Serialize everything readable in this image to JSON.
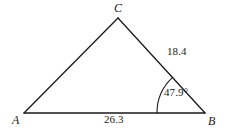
{
  "figure": {
    "type": "triangle-diagram",
    "background_color": "#ffffff",
    "stroke_color": "#1a1a1a"
  },
  "vertices": [
    {
      "id": "A",
      "label": "A",
      "x": 24,
      "y": 113
    },
    {
      "id": "B",
      "label": "B",
      "x": 205,
      "y": 113
    },
    {
      "id": "C",
      "label": "C",
      "x": 118,
      "y": 18
    }
  ],
  "sides": [
    {
      "id": "AB",
      "from": "A",
      "to": "B",
      "label": "26.3",
      "label_position": "below"
    },
    {
      "id": "CB",
      "from": "C",
      "to": "B",
      "label": "18.4",
      "label_position": "right"
    },
    {
      "id": "AC",
      "from": "A",
      "to": "C",
      "label": "",
      "label_position": "none"
    }
  ],
  "angles": [
    {
      "id": "angle-B",
      "vertex": "B",
      "label": "47.9°",
      "value": 47.9,
      "unit": "degrees",
      "arc_radius": 48
    }
  ]
}
